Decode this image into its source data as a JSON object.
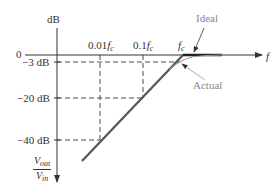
{
  "diagram": {
    "type": "bode-plot-low-pass-rolloff",
    "y_axis": {
      "label": "dB",
      "bottom_label_num": "V",
      "bottom_label_num_sub": "out",
      "bottom_label_den": "V",
      "bottom_label_den_sub": "in"
    },
    "x_axis": {
      "label": "f",
      "origin_label": "0"
    },
    "y_ticks": [
      "−3 dB",
      "−20 dB",
      "−40 dB"
    ],
    "x_ticks": [
      {
        "prefix": "0.01",
        "var": "f",
        "sub": "c"
      },
      {
        "prefix": "0.1",
        "var": "f",
        "sub": "c"
      },
      {
        "prefix": "",
        "var": "f",
        "sub": "c"
      }
    ],
    "annotations": {
      "ideal": "Ideal",
      "actual": "Actual"
    },
    "colors": {
      "line": "#444444",
      "ideal": "#222222",
      "actual": "#999999",
      "dashed": "#333333"
    }
  }
}
